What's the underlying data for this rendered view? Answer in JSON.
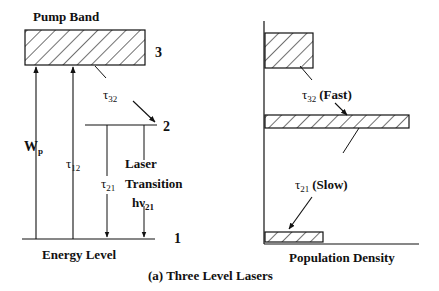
{
  "figure": {
    "caption": "(a) Three Level Lasers"
  },
  "energy_diagram": {
    "pump_band_label": "Pump Band",
    "level_labels": {
      "level3": "3",
      "level2": "2",
      "level1": "1"
    },
    "pump_rate_symbol": "W",
    "pump_rate_subscript": "p",
    "tau12_symbol": "τ",
    "tau12_subscript": "12",
    "tau32_symbol": "τ",
    "tau32_subscript": "32",
    "tau21_symbol": "τ",
    "tau21_subscript": "21",
    "laser_line1": "Laser",
    "laser_line2": "Transition",
    "photon_symbol": "hν",
    "photon_subscript": "21",
    "axis_label": "Energy Level"
  },
  "population_diagram": {
    "fast_symbol": "τ",
    "fast_subscript": "32",
    "fast_label": "(Fast)",
    "slow_symbol": "τ",
    "slow_subscript": "21",
    "slow_label": "(Slow)",
    "axis_label": "Population Density"
  },
  "colors": {
    "ink": "#111111",
    "background": "#ffffff"
  }
}
